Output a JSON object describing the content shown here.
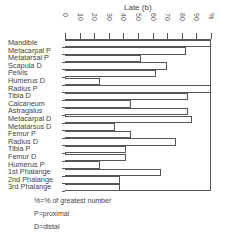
{
  "chart_data": {
    "type": "bar",
    "orientation": "horizontal",
    "title": "Late (b)",
    "xlabel": "Late (b)",
    "ylabel": "",
    "xlim": [
      0,
      100
    ],
    "x_ticks": [
      "0",
      "10",
      "20",
      "30",
      "40",
      "50",
      "60",
      "70",
      "80",
      "90",
      "%"
    ],
    "grid": false,
    "categories": [
      "Mandible",
      "Metacarpal P",
      "Metatarsal P",
      "Scapula D",
      "Pelvis",
      "Humerus D",
      "Radius P",
      "Tibia D",
      "Calcaneum",
      "Astragalus",
      "Metacarpal D",
      "Metatarsus D",
      "Femur P",
      "Radius D",
      "Tibia P",
      "Femur D",
      "Humerus P",
      "1st Phalange",
      "2nd Phalange",
      "3rd Phalange"
    ],
    "values": [
      100,
      83,
      52,
      70,
      62,
      24,
      100,
      84,
      45,
      84,
      87,
      34,
      45,
      76,
      42,
      42,
      24,
      66,
      38,
      38
    ],
    "annotations": [
      "%=% of greatest number",
      "P=proximal",
      "D=distal"
    ]
  },
  "legend": {
    "line1": "%=% of greatest number",
    "line2": "P=proximal",
    "line3": "D=distal"
  }
}
